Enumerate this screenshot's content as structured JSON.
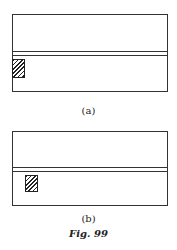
{
  "figure": {
    "caption": "Fig. 99",
    "panels": [
      {
        "id": "a",
        "label": "(a)",
        "description": "Rectangle divided by a thin double-line channel; hatched square at left edge of lower section"
      },
      {
        "id": "b",
        "label": "(b)",
        "description": "Rectangle divided by a thin double-line channel; hatched square offset inward in lower section"
      }
    ]
  }
}
